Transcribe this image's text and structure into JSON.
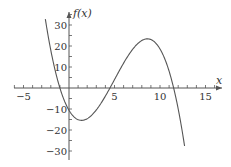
{
  "chart_data": {
    "type": "line",
    "title": "",
    "xlabel": "x",
    "ylabel": "f(x)",
    "xlim": [
      -6.3,
      17
    ],
    "ylim": [
      -32,
      37
    ],
    "grid": false,
    "legend": null,
    "x_ticks": [
      -5,
      5,
      10,
      15
    ],
    "y_ticks": [
      30,
      20,
      10,
      -10,
      -20,
      -30
    ],
    "x_minor_step": 1,
    "y_minor_step": 5,
    "series": [
      {
        "name": "f(x)",
        "description": "cubic with roots near x=-1, 4.5, 11.5; local min ~(1.5,-15.5); local max ~(8.5,23)",
        "x": [
          -2.6,
          -2,
          -1,
          0,
          1,
          1.5,
          2,
          3,
          4,
          4.5,
          5,
          6,
          7,
          8,
          8.5,
          9,
          10,
          11,
          11.5,
          12,
          12.7
        ],
        "y": [
          32,
          22,
          0,
          -11.5,
          -15,
          -15.5,
          -15,
          -11,
          -4,
          0,
          4,
          12,
          19,
          22.5,
          23,
          22,
          16,
          6,
          0,
          -8,
          -32
        ]
      }
    ]
  },
  "axes": {
    "x_label": "x",
    "y_label": "f(x)"
  }
}
